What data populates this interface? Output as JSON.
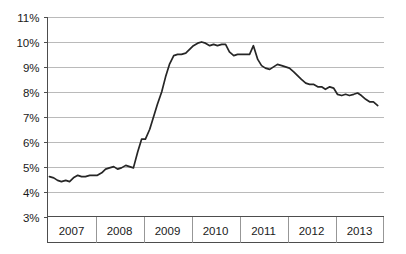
{
  "chart_data": {
    "type": "line",
    "title": "",
    "subtitle": "",
    "xlabel": "",
    "ylabel": "",
    "ylim": [
      3,
      11
    ],
    "xlim": [
      2006.5,
      2013.5
    ],
    "grid": true,
    "legend": false,
    "legend_position": "none",
    "line_color": "#262626",
    "grid_color": "#a9a9a9",
    "axis_color": "#4d4d4d",
    "ytick_labels": [
      "11%",
      "10%",
      "9%",
      "8%",
      "7%",
      "6%",
      "5%",
      "4%",
      "3%"
    ],
    "ytick_values": [
      11,
      10,
      9,
      8,
      7,
      6,
      5,
      4,
      3
    ],
    "xtick_labels": [
      "2007",
      "2008",
      "2009",
      "2010",
      "2011",
      "2012",
      "2013"
    ],
    "xtick_values": [
      2007,
      2008,
      2009,
      2010,
      2011,
      2012,
      2013
    ],
    "series": [
      {
        "name": "Unemployment rate",
        "x": [
          2006.54,
          2006.63,
          2006.71,
          2006.79,
          2006.88,
          2006.96,
          2007.04,
          2007.13,
          2007.21,
          2007.29,
          2007.38,
          2007.46,
          2007.54,
          2007.63,
          2007.71,
          2007.79,
          2007.88,
          2007.96,
          2008.04,
          2008.13,
          2008.21,
          2008.29,
          2008.38,
          2008.46,
          2008.54,
          2008.63,
          2008.71,
          2008.79,
          2008.88,
          2008.96,
          2009.04,
          2009.13,
          2009.21,
          2009.29,
          2009.38,
          2009.46,
          2009.54,
          2009.63,
          2009.71,
          2009.79,
          2009.88,
          2009.96,
          2010.04,
          2010.13,
          2010.21,
          2010.29,
          2010.38,
          2010.46,
          2010.54,
          2010.63,
          2010.71,
          2010.79,
          2010.88,
          2010.96,
          2011.04,
          2011.13,
          2011.21,
          2011.29,
          2011.38,
          2011.46,
          2011.54,
          2011.63,
          2011.71,
          2011.79,
          2011.88,
          2011.96,
          2012.04,
          2012.13,
          2012.21,
          2012.29,
          2012.38,
          2012.46,
          2012.54,
          2012.63,
          2012.71,
          2012.79,
          2012.88,
          2012.96,
          2013.04,
          2013.13,
          2013.21,
          2013.29,
          2013.38
        ],
        "values": [
          4.6,
          4.55,
          4.45,
          4.4,
          4.45,
          4.4,
          4.55,
          4.65,
          4.6,
          4.6,
          4.65,
          4.65,
          4.65,
          4.75,
          4.9,
          4.95,
          5.0,
          4.9,
          4.95,
          5.05,
          5.0,
          4.95,
          5.6,
          6.1,
          6.1,
          6.5,
          7.0,
          7.5,
          8.0,
          8.6,
          9.1,
          9.45,
          9.5,
          9.5,
          9.55,
          9.7,
          9.85,
          9.95,
          10.0,
          9.95,
          9.85,
          9.9,
          9.85,
          9.9,
          9.9,
          9.6,
          9.45,
          9.5,
          9.5,
          9.5,
          9.5,
          9.85,
          9.3,
          9.05,
          8.95,
          8.9,
          9.0,
          9.1,
          9.05,
          9.0,
          8.95,
          8.8,
          8.65,
          8.5,
          8.35,
          8.3,
          8.3,
          8.2,
          8.2,
          8.1,
          8.2,
          8.15,
          7.9,
          7.85,
          7.9,
          7.85,
          7.9,
          7.95,
          7.85,
          7.7,
          7.6,
          7.6,
          7.45
        ]
      }
    ]
  }
}
